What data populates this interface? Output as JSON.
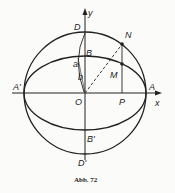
{
  "figure": {
    "caption": "Abb. 72",
    "labels": {
      "y_axis": "y",
      "x_axis": "x",
      "D": "D",
      "D_prime": "D'",
      "B": "B",
      "B_prime": "B'",
      "A": "A",
      "A_prime": "A'",
      "O": "O",
      "P": "P",
      "N": "N",
      "M": "M",
      "a": "a",
      "b": "b"
    },
    "colors": {
      "line": "#222222",
      "background": "#fbfbf9"
    }
  }
}
